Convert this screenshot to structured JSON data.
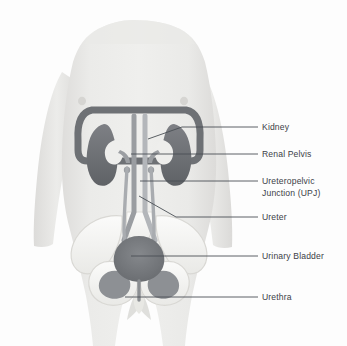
{
  "diagram": {
    "background_color": "#fdfdfd",
    "skin_color": "#e6e6e4",
    "bone_color": "#f4f4f2",
    "organ_color": "#6f7276",
    "text_color": "#3c4147",
    "leader_color": "#4a4f55"
  },
  "labels": [
    {
      "id": "kidney",
      "text": "Kidney",
      "x": 262,
      "y": 123
    },
    {
      "id": "renal-pelvis",
      "text": "Renal Pelvis",
      "x": 262,
      "y": 150
    },
    {
      "id": "upj",
      "text": "Ureteropelvic\nJunction (UPJ)",
      "x": 262,
      "y": 177
    },
    {
      "id": "ureter",
      "text": "Ureter",
      "x": 262,
      "y": 213
    },
    {
      "id": "urinary-bladder",
      "text": "Urinary Bladder",
      "x": 262,
      "y": 252
    },
    {
      "id": "urethra",
      "text": "Urethra",
      "x": 262,
      "y": 293
    }
  ],
  "leaders": [
    {
      "id": "kidney-leader",
      "points": "148,139 182,127 258,127"
    },
    {
      "id": "renal-pelvis-leader",
      "points": "131,154 258,154"
    },
    {
      "id": "upj-leader",
      "points": "140,181 258,181"
    },
    {
      "id": "ureter-leader",
      "points": "139,196 176,217 258,217"
    },
    {
      "id": "bladder-leader",
      "points": "131,256 258,256"
    },
    {
      "id": "urethra-leader",
      "points": "125,297 258,297"
    }
  ],
  "organs": [
    {
      "id": "left-kidney",
      "name": "Kidney"
    },
    {
      "id": "right-kidney",
      "name": "Kidney"
    },
    {
      "id": "renal-pelvis",
      "name": "Renal Pelvis"
    },
    {
      "id": "upj",
      "name": "Ureteropelvic Junction"
    },
    {
      "id": "left-ureter",
      "name": "Ureter"
    },
    {
      "id": "right-ureter",
      "name": "Ureter"
    },
    {
      "id": "bladder",
      "name": "Urinary Bladder"
    },
    {
      "id": "urethra",
      "name": "Urethra"
    },
    {
      "id": "aorta",
      "name": "Aorta"
    },
    {
      "id": "vena-cava",
      "name": "Inferior Vena Cava"
    }
  ],
  "skeleton": [
    {
      "id": "ribcage-arch",
      "name": "Rib Cage / Diaphragm Arch"
    },
    {
      "id": "spine",
      "name": "Lumbar Spine"
    },
    {
      "id": "sacrum",
      "name": "Sacrum"
    },
    {
      "id": "left-ilium",
      "name": "Ilium"
    },
    {
      "id": "right-ilium",
      "name": "Ilium"
    },
    {
      "id": "pubis",
      "name": "Pubic Bone"
    }
  ]
}
